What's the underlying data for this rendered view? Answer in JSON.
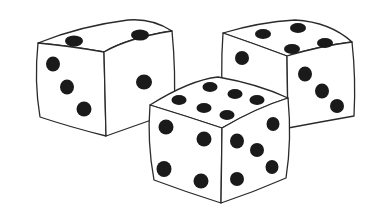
{
  "scene": {
    "title": "Three dice illustration",
    "style": "hand-drawn black line art on white",
    "background": "#ffffff",
    "ink_color": "#1a1a1a"
  },
  "dice": [
    {
      "name": "left-die",
      "position": "back-left",
      "top_face": 2,
      "front_left_face": 3,
      "front_right_face": 1
    },
    {
      "name": "right-die",
      "position": "back-right",
      "top_face": 4,
      "front_left_face": 1,
      "front_right_face": 3
    },
    {
      "name": "front-die",
      "position": "front-center",
      "top_face": 6,
      "front_left_face": 4,
      "front_right_face": 5
    }
  ]
}
